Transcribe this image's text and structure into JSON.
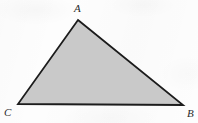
{
  "figure": {
    "kind": "geometry-diagram",
    "shape_name": "triangle",
    "canvas": {
      "width": 198,
      "height": 123
    },
    "background_color": "#fdfdfd",
    "fill_color": "#c9c9c9",
    "stroke_color": "#1c1c1c",
    "stroke_width": 1.8,
    "vertices": [
      {
        "id": "A",
        "label": "A",
        "x": 78,
        "y": 20,
        "label_x": 74,
        "label_y": 3,
        "position": "apex"
      },
      {
        "id": "B",
        "label": "B",
        "x": 183,
        "y": 105,
        "label_x": 187,
        "label_y": 108,
        "position": "bottom-right"
      },
      {
        "id": "C",
        "label": "C",
        "x": 18,
        "y": 104,
        "label_x": 4,
        "label_y": 107,
        "position": "bottom-left"
      }
    ],
    "edges": [
      {
        "id": "CA",
        "from": "C",
        "to": "A"
      },
      {
        "id": "AB",
        "from": "A",
        "to": "B"
      },
      {
        "id": "BC",
        "from": "B",
        "to": "C"
      }
    ],
    "polygon_points": "78,20 183,105 18,104"
  }
}
